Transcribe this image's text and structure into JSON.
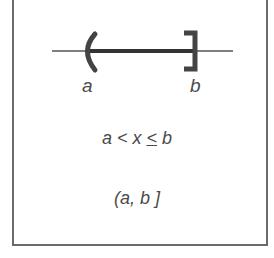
{
  "diagram": {
    "type": "interval-number-line",
    "left_endpoint": {
      "label": "a",
      "bracket": "(",
      "closed": false
    },
    "right_endpoint": {
      "label": "b",
      "bracket": "]",
      "closed": true
    },
    "inequality": {
      "a": "a",
      "lt": " < ",
      "x": "x",
      "sp": " ",
      "le": "<",
      "sp2": " ",
      "b": "b"
    },
    "interval_notation": "(a, b ]",
    "colors": {
      "line": "#555555",
      "segment": "#333333",
      "text": "#4a4a4a",
      "border": "#6a6a6a"
    }
  }
}
